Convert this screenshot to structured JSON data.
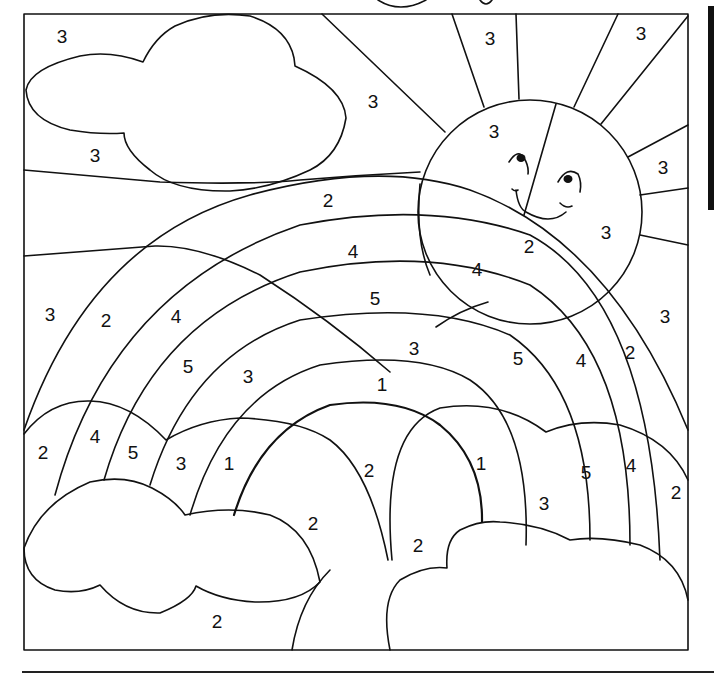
{
  "page": {
    "line_color": "#111111",
    "background": "#ffffff"
  },
  "labels": [
    {
      "id": "sky-top-left",
      "value": "3",
      "x": 62,
      "y": 36
    },
    {
      "id": "sky-under-cloud",
      "value": "3",
      "x": 95,
      "y": 155
    },
    {
      "id": "sky-center",
      "value": "3",
      "x": 373,
      "y": 101
    },
    {
      "id": "ray-top-1",
      "value": "3",
      "x": 490,
      "y": 38
    },
    {
      "id": "ray-top-2",
      "value": "3",
      "x": 641,
      "y": 33
    },
    {
      "id": "sun-left",
      "value": "3",
      "x": 494,
      "y": 131
    },
    {
      "id": "ray-right-1",
      "value": "3",
      "x": 663,
      "y": 167
    },
    {
      "id": "sun-right",
      "value": "3",
      "x": 606,
      "y": 232
    },
    {
      "id": "ray-right-2",
      "value": "3",
      "x": 665,
      "y": 316
    },
    {
      "id": "band-outer-2-top",
      "value": "2",
      "x": 328,
      "y": 200
    },
    {
      "id": "band-outer-2-sun",
      "value": "2",
      "x": 529,
      "y": 246
    },
    {
      "id": "band-4-top",
      "value": "4",
      "x": 353,
      "y": 251
    },
    {
      "id": "band-4-right",
      "value": "4",
      "x": 477,
      "y": 269
    },
    {
      "id": "band-5-top",
      "value": "5",
      "x": 375,
      "y": 298
    },
    {
      "id": "sky-left",
      "value": "3",
      "x": 50,
      "y": 314
    },
    {
      "id": "band-2-left",
      "value": "2",
      "x": 106,
      "y": 320
    },
    {
      "id": "band-4-left",
      "value": "4",
      "x": 176,
      "y": 316
    },
    {
      "id": "band-3-top",
      "value": "3",
      "x": 414,
      "y": 348
    },
    {
      "id": "band-5-right",
      "value": "5",
      "x": 518,
      "y": 358
    },
    {
      "id": "band-4-right-lower",
      "value": "4",
      "x": 581,
      "y": 360
    },
    {
      "id": "band-2-right",
      "value": "2",
      "x": 630,
      "y": 352
    },
    {
      "id": "band-5-left",
      "value": "5",
      "x": 188,
      "y": 366
    },
    {
      "id": "band-3-left",
      "value": "3",
      "x": 248,
      "y": 376
    },
    {
      "id": "band-1-top",
      "value": "1",
      "x": 382,
      "y": 384
    },
    {
      "id": "cloud-left-2",
      "value": "2",
      "x": 43,
      "y": 452
    },
    {
      "id": "cloud-left-4",
      "value": "4",
      "x": 95,
      "y": 436
    },
    {
      "id": "cloud-left-5",
      "value": "5",
      "x": 133,
      "y": 452
    },
    {
      "id": "cloud-left-3",
      "value": "3",
      "x": 181,
      "y": 463
    },
    {
      "id": "cloud-left-1",
      "value": "1",
      "x": 229,
      "y": 463
    },
    {
      "id": "inner-left-2",
      "value": "2",
      "x": 369,
      "y": 470
    },
    {
      "id": "inner-right-1",
      "value": "1",
      "x": 481,
      "y": 463
    },
    {
      "id": "cloud-right-5",
      "value": "5",
      "x": 586,
      "y": 472
    },
    {
      "id": "cloud-right-4",
      "value": "4",
      "x": 631,
      "y": 465
    },
    {
      "id": "cloud-right-2",
      "value": "2",
      "x": 676,
      "y": 492
    },
    {
      "id": "cloud-right-3",
      "value": "3",
      "x": 544,
      "y": 503
    },
    {
      "id": "inner-left-2b",
      "value": "2",
      "x": 313,
      "y": 523
    },
    {
      "id": "inner-right-2",
      "value": "2",
      "x": 418,
      "y": 545
    },
    {
      "id": "ground-2",
      "value": "2",
      "x": 217,
      "y": 621
    }
  ]
}
